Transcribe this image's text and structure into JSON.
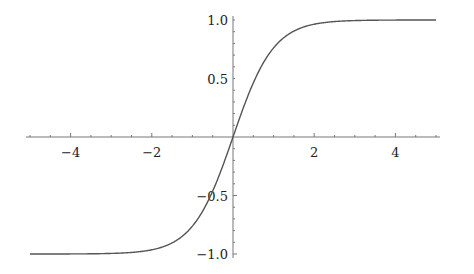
{
  "chart_data": {
    "type": "line",
    "title": "",
    "xlabel": "",
    "ylabel": "",
    "function": "tanh(x)",
    "xlim": [
      -5,
      5
    ],
    "ylim": [
      -1,
      1
    ],
    "grid": false,
    "legend": null,
    "x_ticks": [
      -4,
      -2,
      2,
      4
    ],
    "x_tick_labels": [
      "−4",
      "−2",
      "2",
      "4"
    ],
    "y_ticks": [
      -1.0,
      -0.5,
      0.5,
      1.0
    ],
    "y_tick_labels": [
      "−1.0",
      "−0.5",
      "0.5",
      "1.0"
    ],
    "series": [
      {
        "name": "tanh(x)",
        "color": "#555555",
        "x": [
          -5,
          -4,
          -3,
          -2.5,
          -2,
          -1.5,
          -1,
          -0.5,
          0,
          0.5,
          1,
          1.5,
          2,
          2.5,
          3,
          4,
          5
        ],
        "y": [
          -1.0,
          -0.999,
          -0.995,
          -0.987,
          -0.964,
          -0.905,
          -0.762,
          -0.462,
          0,
          0.462,
          0.762,
          0.905,
          0.964,
          0.987,
          0.995,
          0.999,
          1.0
        ]
      }
    ]
  }
}
